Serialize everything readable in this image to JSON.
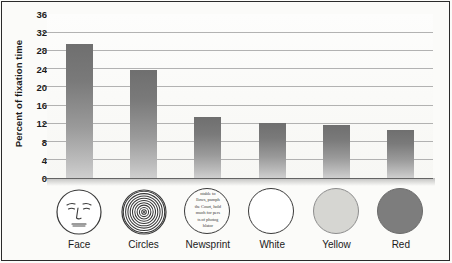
{
  "chart_data": {
    "type": "bar",
    "title": "",
    "subtitle": "",
    "xlabel": "",
    "ylabel": "Percent of fixation time",
    "categories": [
      "Face",
      "Circles",
      "Newsprint",
      "White",
      "Yellow",
      "Red"
    ],
    "values": [
      29.5,
      23.8,
      13.5,
      12.0,
      11.7,
      10.5
    ],
    "ylim": [
      0,
      36
    ],
    "ytick_step": 4,
    "ytick_labels": [
      "0",
      "4",
      "8",
      "12",
      "16",
      "20",
      "24",
      "28",
      "32",
      "36"
    ],
    "grid": "horizontal",
    "legend": "none",
    "bar_color": "#7a7a7a",
    "background_color": "#fbfbf9",
    "gridline_color": "#9a9a9a"
  },
  "icons": [
    {
      "name": "face-icon",
      "kind": "line-drawing-face",
      "label": "Face",
      "fill": "#ffffff"
    },
    {
      "name": "concentric-circles-icon",
      "kind": "concentric-rings",
      "label": "Circles",
      "fill": "#ffffff",
      "ring_count": 9
    },
    {
      "name": "newsprint-icon",
      "kind": "text-swatch",
      "label": "Newsprint",
      "fill": "#fcfcfa",
      "text": "ntable to ... llows, pamph ... the Court, hold ... much for pers ... ts of photog ... hlator"
    },
    {
      "name": "white-circle-icon",
      "kind": "solid-circle",
      "label": "White",
      "fill": "#ffffff"
    },
    {
      "name": "yellow-circle-icon",
      "kind": "solid-circle",
      "label": "Yellow",
      "fill": "#d6d6d2"
    },
    {
      "name": "red-circle-icon",
      "kind": "solid-circle",
      "label": "Red",
      "fill": "#7d7d7d"
    }
  ],
  "newsprint_lines": [
    "ntable to",
    "llows, pamph",
    "the Court, hold",
    "much for pers",
    "ts of photog",
    "hlator"
  ]
}
